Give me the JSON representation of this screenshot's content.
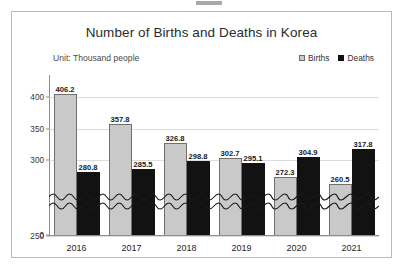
{
  "frame": {
    "artifact_name": "scan-artifact"
  },
  "chart_data": {
    "type": "bar",
    "title": "Number of Births and Deaths in Korea",
    "subtitle": "Unit: Thousand people",
    "xlabel": "",
    "ylabel": "",
    "categories": [
      "2016",
      "2017",
      "2018",
      "2019",
      "2020",
      "2021"
    ],
    "series": [
      {
        "name": "Births",
        "color": "#c9c9c9",
        "values": [
          406.2,
          357.8,
          326.8,
          302.7,
          272.3,
          260.5
        ]
      },
      {
        "name": "Deaths",
        "color": "#121212",
        "values": [
          280.8,
          285.5,
          298.8,
          295.1,
          304.9,
          317.8
        ]
      }
    ],
    "ytick_labels": [
      "400",
      "350",
      "300",
      "250",
      "0"
    ],
    "ytick_values": [
      400,
      350,
      300,
      250,
      0
    ],
    "ylim": [
      240,
      420
    ],
    "axis_break": true,
    "axis_break_note": "broken y-axis between 0 and 250 shown with double wavy line",
    "grid": true,
    "legend_position": "top-right"
  },
  "legend": {
    "births_label": "Births",
    "deaths_label": "Deaths"
  }
}
